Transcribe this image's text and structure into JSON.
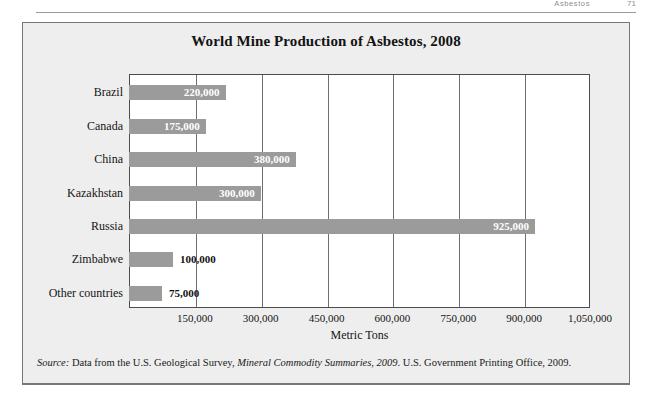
{
  "page_header": {
    "section_text": "Asbestos",
    "page_number": "71"
  },
  "figure": {
    "title": "World Mine Production of Asbestos, 2008",
    "source_prefix": "Source:",
    "source_text_1": " Data from the U.S. Geological Survey, ",
    "source_italic": "Mineral Commodity Summaries, 2009",
    "source_text_2": ". U.S. Government Printing Office, 2009.",
    "colors": {
      "bar": "#9b9b9b",
      "panel_background": "#eeeeee",
      "plot_background": "#ffffff",
      "axis": "#4c4c4e",
      "gridline": "#6e6e70",
      "value_label_inside": "#ffffff",
      "value_label_outside": "#111111"
    }
  },
  "chart_data": {
    "type": "bar",
    "orientation": "horizontal",
    "title": "World Mine Production of Asbestos, 2008",
    "xlabel": "Metric Tons",
    "ylabel": "",
    "categories": [
      "Brazil",
      "Canada",
      "China",
      "Kazakhstan",
      "Russia",
      "Zimbabwe",
      "Other countries"
    ],
    "values": [
      220000,
      175000,
      380000,
      300000,
      925000,
      100000,
      75000
    ],
    "value_labels": [
      "220,000",
      "175,000",
      "380,000",
      "300,000",
      "925,000",
      "100,000",
      "75,000"
    ],
    "label_placement": [
      "inside",
      "inside",
      "inside",
      "inside",
      "inside",
      "outside",
      "outside"
    ],
    "xlim": [
      0,
      1050000
    ],
    "xticks": [
      150000,
      300000,
      450000,
      600000,
      750000,
      900000,
      1050000
    ],
    "xticklabels": [
      "150,000",
      "300,000",
      "450,000",
      "600,000",
      "750,000",
      "900,000",
      "1,050,000"
    ],
    "grid": true,
    "grid_axis": "x",
    "legend": false
  }
}
